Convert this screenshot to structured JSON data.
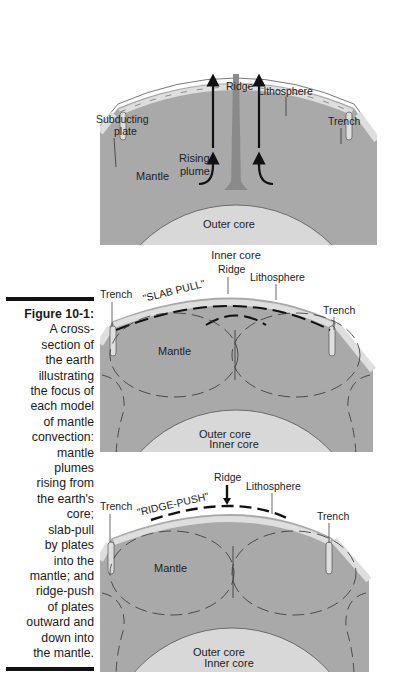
{
  "caption": {
    "figure_label": "Figure 10-1:",
    "lines": [
      "A cross-",
      "section of",
      "the earth",
      "illustrating",
      "the focus of",
      "each model",
      "of mantle",
      "convection:",
      "mantle",
      "plumes",
      "rising from",
      "the earth's",
      "core;",
      "slab-pull",
      "by plates",
      "into the",
      "mantle; and",
      "ridge-push",
      "of plates",
      "outward and",
      "down into",
      "the mantle."
    ]
  },
  "colors": {
    "mantle": "#a9a9a9",
    "outer_core": "#d8d8d8",
    "inner_core": "#ffffff",
    "lithosphere": "#dedede",
    "plume": "#8a8a8a",
    "outline": "#555555"
  },
  "panels": [
    {
      "model": "mantle-plume",
      "labels": {
        "ridge": "Ridge",
        "lithosphere": "Lithosphere",
        "subducting_plate": [
          "Subducting",
          "plate"
        ],
        "trench": "Trench",
        "mantle": "Mantle",
        "rising_plume": [
          "Rising",
          "plume"
        ],
        "outer_core": "Outer core",
        "inner_core": "Inner core"
      }
    },
    {
      "model": "slab-pull",
      "labels": {
        "ridge": "Ridge",
        "lithosphere": "Lithosphere",
        "trench_left": "Trench",
        "trench_right": "Trench",
        "force": "\"SLAB PULL\"",
        "mantle": "Mantle",
        "outer_core": "Outer core",
        "inner_core": "Inner core"
      }
    },
    {
      "model": "ridge-push",
      "labels": {
        "ridge": "Ridge",
        "lithosphere": "Lithosphere",
        "trench_left": "Trench",
        "trench_right": "Trench",
        "force": "\"RIDGE-PUSH\"",
        "mantle": "Mantle",
        "outer_core": "Outer core",
        "inner_core": "Inner core"
      }
    }
  ]
}
